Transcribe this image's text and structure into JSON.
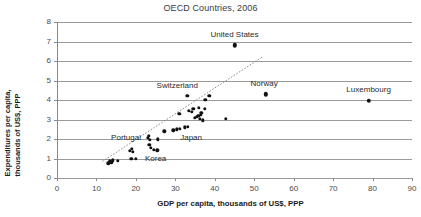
{
  "chart_data": {
    "type": "scatter",
    "title": "OECD Countries, 2006",
    "xlabel": "GDP per capita, thousands of US$, PPP",
    "ylabel_line1": "Expenditures per capita,",
    "ylabel_line2": "thousands of US$, PPP",
    "xlim": [
      0,
      90
    ],
    "ylim": [
      0,
      8
    ],
    "xticks": [
      0,
      10,
      20,
      30,
      40,
      50,
      60,
      70,
      80,
      90
    ],
    "yticks": [
      0,
      1,
      2,
      3,
      4,
      5,
      6,
      7,
      8
    ],
    "grid": "horizontal",
    "legend": "none",
    "colors": {
      "point": "#111111",
      "gridline": "#9a9a9a",
      "trendline": "#808080",
      "background": "#ffffff"
    },
    "points": [
      {
        "x": 13.0,
        "y": 0.75
      },
      {
        "x": 13.4,
        "y": 0.85
      },
      {
        "x": 13.8,
        "y": 0.8
      },
      {
        "x": 14.2,
        "y": 0.9
      },
      {
        "x": 15.4,
        "y": 0.88
      },
      {
        "x": 18.8,
        "y": 1.0
      },
      {
        "x": 18.4,
        "y": 1.4
      },
      {
        "x": 18.9,
        "y": 1.5
      },
      {
        "x": 19.2,
        "y": 1.35
      },
      {
        "x": 23.2,
        "y": 2.15
      },
      {
        "x": 23.6,
        "y": 1.95
      },
      {
        "x": 23.4,
        "y": 1.7
      },
      {
        "x": 23.8,
        "y": 1.55
      },
      {
        "x": 24.6,
        "y": 1.45
      },
      {
        "x": 25.4,
        "y": 1.42
      },
      {
        "x": 25.6,
        "y": 1.98
      },
      {
        "x": 27.2,
        "y": 2.4
      },
      {
        "x": 30.4,
        "y": 2.5
      },
      {
        "x": 31.2,
        "y": 2.52
      },
      {
        "x": 31.0,
        "y": 3.3
      },
      {
        "x": 32.4,
        "y": 2.6
      },
      {
        "x": 33.2,
        "y": 2.62
      },
      {
        "x": 33.4,
        "y": 3.45
      },
      {
        "x": 34.2,
        "y": 3.4
      },
      {
        "x": 34.6,
        "y": 3.55
      },
      {
        "x": 35.0,
        "y": 3.1
      },
      {
        "x": 35.4,
        "y": 3.15
      },
      {
        "x": 35.8,
        "y": 3.2
      },
      {
        "x": 36.0,
        "y": 3.6
      },
      {
        "x": 36.2,
        "y": 3.05
      },
      {
        "x": 36.4,
        "y": 3.25
      },
      {
        "x": 36.6,
        "y": 3.35
      },
      {
        "x": 37.0,
        "y": 2.95
      },
      {
        "x": 37.4,
        "y": 3.55
      },
      {
        "x": 37.6,
        "y": 4.0
      },
      {
        "x": 38.6,
        "y": 4.2
      },
      {
        "x": 42.8,
        "y": 3.05
      }
    ],
    "labeled_points": [
      {
        "label": "United States",
        "x": 45.0,
        "y": 6.8,
        "label_dx": 0.0,
        "label_dy": 0.55
      },
      {
        "label": "Switzerland",
        "x": 33.0,
        "y": 4.2,
        "label_dx": -2.5,
        "label_dy": 0.5
      },
      {
        "label": "Norway",
        "x": 53.0,
        "y": 4.3,
        "label_dx": -0.5,
        "label_dy": 0.52
      },
      {
        "label": "Luxembourg",
        "x": 79.0,
        "y": 3.95,
        "label_dx": 0.0,
        "label_dy": 0.55
      },
      {
        "label": "Portugal",
        "x": 23.0,
        "y": 2.05,
        "label_dx": -5.5,
        "label_dy": 0.0
      },
      {
        "label": "Japan",
        "x": 29.5,
        "y": 2.45,
        "label_dx": 4.5,
        "label_dy": -0.42
      },
      {
        "label": "Korea",
        "x": 20.0,
        "y": 1.0,
        "label_dx": 5.0,
        "label_dy": 0.0
      }
    ],
    "trendline": {
      "x1": 11.5,
      "y1": 0.85,
      "x2": 52.0,
      "y2": 6.2,
      "style": "dotted"
    }
  }
}
